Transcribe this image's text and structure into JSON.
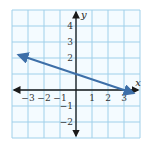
{
  "chart_data": {
    "type": "line",
    "title": "",
    "xlabel": "x",
    "ylabel": "y",
    "xlim": [
      -4,
      4
    ],
    "ylim": [
      -3,
      5
    ],
    "grid": true,
    "x_ticks": [
      "−3",
      "−2",
      "−1",
      "1",
      "2",
      "3"
    ],
    "y_ticks": [
      "4",
      "3",
      "2",
      "−1",
      "−2"
    ],
    "series": [
      {
        "name": "line",
        "equation": "y = -x/3 + 1",
        "points": [
          [
            -3.6,
            2.2
          ],
          [
            0,
            1
          ],
          [
            3,
            0
          ],
          [
            3.6,
            -0.2
          ]
        ],
        "color": "#3d6fa8",
        "arrows": "both"
      }
    ]
  },
  "colors": {
    "grid": "#9fd0ea",
    "axis": "#1a1a1a",
    "line": "#3d6fa8",
    "background": "#ffffff",
    "plot_bg": "#f4fbff"
  }
}
